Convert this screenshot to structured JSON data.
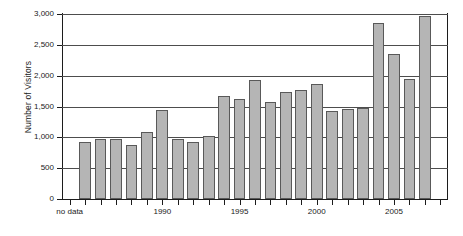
{
  "chart_data": {
    "type": "bar",
    "title": "",
    "xlabel": "",
    "ylabel": "Number of Visitors",
    "ylim": [
      0,
      3000
    ],
    "ytick_step": 500,
    "grid": true,
    "legend": null,
    "bar_color": "#b5b5b5",
    "bar_edge_color": "#595959",
    "axis_color": "#1c1c1c",
    "categories": [
      "no data",
      "1985",
      "1986",
      "1987",
      "1988",
      "1989",
      "1990",
      "1991",
      "1992",
      "1993",
      "1994",
      "1995",
      "1996",
      "1997",
      "1998",
      "1999",
      "2000",
      "2001",
      "2002",
      "2003",
      "2004",
      "2005",
      "2006",
      "2007",
      "2008"
    ],
    "values": [
      null,
      930,
      980,
      980,
      870,
      1080,
      1450,
      975,
      920,
      1015,
      1665,
      1620,
      1925,
      1575,
      1735,
      1765,
      1870,
      1425,
      1465,
      1480,
      2850,
      2345,
      1940,
      2960,
      null
    ],
    "bars": [
      {
        "label": "no data",
        "value": null
      },
      {
        "label": "1985",
        "value": 930
      },
      {
        "label": "1986",
        "value": 980
      },
      {
        "label": "1987",
        "value": 980
      },
      {
        "label": "1988",
        "value": 870
      },
      {
        "label": "1989",
        "value": 1080
      },
      {
        "label": "1990",
        "value": 1450
      },
      {
        "label": "1991",
        "value": 975
      },
      {
        "label": "1992",
        "value": 920
      },
      {
        "label": "1993",
        "value": 1015
      },
      {
        "label": "1994",
        "value": 1665
      },
      {
        "label": "1995",
        "value": 1620
      },
      {
        "label": "1996",
        "value": 1925
      },
      {
        "label": "1997",
        "value": 1575
      },
      {
        "label": "1998",
        "value": 1735
      },
      {
        "label": "1999",
        "value": 1765
      },
      {
        "label": "2000",
        "value": 1870
      },
      {
        "label": "2001",
        "value": 1425
      },
      {
        "label": "2002",
        "value": 1465
      },
      {
        "label": "2003",
        "value": 1480
      },
      {
        "label": "2004",
        "value": 2850
      },
      {
        "label": "2005",
        "value": 2345
      },
      {
        "label": "2006",
        "value": 1940
      },
      {
        "label": "2007",
        "value": 2960
      }
    ],
    "ytick_labels": [
      "3,000",
      "2,500",
      "2,000",
      "1,500",
      "1,000",
      "500",
      "0"
    ],
    "ytick_values": [
      3000,
      2500,
      2000,
      1500,
      1000,
      500,
      0
    ],
    "xtick_labels": [
      {
        "text": "no data",
        "index": 0
      },
      {
        "text": "1990",
        "index": 6
      },
      {
        "text": "1995",
        "index": 11
      },
      {
        "text": "2000",
        "index": 16
      },
      {
        "text": "2005",
        "index": 21
      }
    ]
  }
}
